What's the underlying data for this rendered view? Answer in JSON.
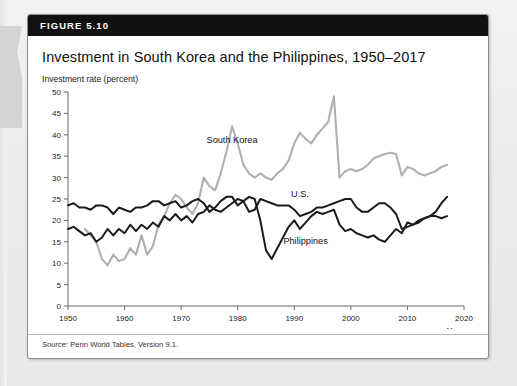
{
  "figure": {
    "number_label": "FIGURE 5.10",
    "title": "Investment in South Korea and the Philippines, 1950–2017",
    "source_label": "Source:",
    "source_text": " Penn World Tables, Version 9.1."
  },
  "colors": {
    "header_background": "#111111",
    "header_text": "#ffffff",
    "card_background": "#ffffff",
    "page_background": "#ececec",
    "south_korea": "#b0b0b0",
    "philippines": "#1a1a1a",
    "united_states": "#1a1a1a",
    "axis": "#6b6b6b"
  },
  "chart_data": {
    "type": "line",
    "title": "Investment in South Korea and the Philippines, 1950–2017",
    "ylabel": "Investment rate (percent)",
    "xlabel": "Year",
    "xlim": [
      1950,
      2020
    ],
    "ylim": [
      0,
      50
    ],
    "grid": false,
    "legend": "inline-labels",
    "xticks": [
      1950,
      1960,
      1970,
      1980,
      1990,
      2000,
      2010,
      2020
    ],
    "yticks": [
      0,
      5,
      10,
      15,
      20,
      25,
      30,
      35,
      40,
      45,
      50
    ],
    "annotations": [
      {
        "text": "South Korea",
        "x": 1979,
        "y": 38
      },
      {
        "text": "U.S.",
        "x": 1991,
        "y": 25.5
      },
      {
        "text": "Philippines",
        "x": 1992,
        "y": 14.5
      }
    ],
    "series": [
      {
        "name": "South Korea",
        "color": "#b0b0b0",
        "x": [
          1953,
          1954,
          1955,
          1956,
          1957,
          1958,
          1959,
          1960,
          1961,
          1962,
          1963,
          1964,
          1965,
          1966,
          1967,
          1968,
          1969,
          1970,
          1971,
          1972,
          1973,
          1974,
          1975,
          1976,
          1977,
          1978,
          1979,
          1980,
          1981,
          1982,
          1983,
          1984,
          1985,
          1986,
          1987,
          1988,
          1989,
          1990,
          1991,
          1992,
          1993,
          1994,
          1995,
          1996,
          1997,
          1998,
          1999,
          2000,
          2001,
          2002,
          2003,
          2004,
          2005,
          2006,
          2007,
          2008,
          2009,
          2010,
          2011,
          2012,
          2013,
          2014,
          2015,
          2016,
          2017
        ],
        "values": [
          18.0,
          16.5,
          15.0,
          11.0,
          9.5,
          12.0,
          10.5,
          11.0,
          13.5,
          12.0,
          16.5,
          12.0,
          14.0,
          19.0,
          21.0,
          24.0,
          26.0,
          25.0,
          23.0,
          21.5,
          24.0,
          30.0,
          28.0,
          27.0,
          31.0,
          36.0,
          42.0,
          38.0,
          33.0,
          31.0,
          30.0,
          31.0,
          30.0,
          29.5,
          31.0,
          32.0,
          34.0,
          38.0,
          40.5,
          39.0,
          38.0,
          40.0,
          41.5,
          43.0,
          49.0,
          30.0,
          31.5,
          32.0,
          31.5,
          32.0,
          33.0,
          34.5,
          35.0,
          35.5,
          35.8,
          35.5,
          30.5,
          32.5,
          32.0,
          31.0,
          30.5,
          31.0,
          31.5,
          32.5,
          33.0
        ]
      },
      {
        "name": "Philippines",
        "color": "#1a1a1a",
        "x": [
          1950,
          1951,
          1952,
          1953,
          1954,
          1955,
          1956,
          1957,
          1958,
          1959,
          1960,
          1961,
          1962,
          1963,
          1964,
          1965,
          1966,
          1967,
          1968,
          1969,
          1970,
          1971,
          1972,
          1973,
          1974,
          1975,
          1976,
          1977,
          1978,
          1979,
          1980,
          1981,
          1982,
          1983,
          1984,
          1985,
          1986,
          1987,
          1988,
          1989,
          1990,
          1991,
          1992,
          1993,
          1994,
          1995,
          1996,
          1997,
          1998,
          1999,
          2000,
          2001,
          2002,
          2003,
          2004,
          2005,
          2006,
          2007,
          2008,
          2009,
          2010,
          2011,
          2012,
          2013,
          2014,
          2015,
          2016,
          2017
        ],
        "values": [
          18.0,
          18.5,
          17.5,
          16.5,
          17.0,
          15.0,
          16.0,
          18.0,
          16.5,
          18.0,
          17.0,
          19.0,
          17.5,
          19.0,
          18.0,
          19.5,
          18.5,
          21.0,
          20.0,
          21.5,
          20.0,
          21.0,
          19.5,
          21.5,
          22.0,
          23.5,
          22.5,
          22.0,
          23.0,
          24.0,
          25.0,
          24.5,
          25.5,
          25.0,
          20.0,
          13.0,
          11.0,
          13.5,
          16.0,
          18.5,
          20.0,
          18.0,
          19.5,
          21.0,
          22.0,
          21.5,
          22.0,
          22.5,
          19.0,
          17.5,
          18.0,
          17.0,
          16.5,
          16.0,
          16.5,
          15.5,
          15.0,
          16.5,
          18.0,
          17.0,
          19.5,
          19.0,
          19.5,
          20.5,
          21.0,
          22.0,
          24.0,
          25.5
        ]
      },
      {
        "name": "U.S.",
        "color": "#1a1a1a",
        "x": [
          1950,
          1951,
          1952,
          1953,
          1954,
          1955,
          1956,
          1957,
          1958,
          1959,
          1960,
          1961,
          1962,
          1963,
          1964,
          1965,
          1966,
          1967,
          1968,
          1969,
          1970,
          1971,
          1972,
          1973,
          1974,
          1975,
          1976,
          1977,
          1978,
          1979,
          1980,
          1981,
          1982,
          1983,
          1984,
          1985,
          1986,
          1987,
          1988,
          1989,
          1990,
          1991,
          1992,
          1993,
          1994,
          1995,
          1996,
          1997,
          1998,
          1999,
          2000,
          2001,
          2002,
          2003,
          2004,
          2005,
          2006,
          2007,
          2008,
          2009,
          2010,
          2011,
          2012,
          2013,
          2014,
          2015,
          2016,
          2017
        ],
        "values": [
          23.5,
          24.0,
          23.0,
          23.0,
          22.5,
          23.5,
          23.5,
          23.0,
          21.5,
          23.0,
          22.5,
          22.0,
          23.0,
          23.0,
          23.5,
          24.5,
          24.5,
          23.5,
          24.0,
          24.5,
          23.0,
          23.5,
          24.5,
          25.0,
          24.0,
          22.0,
          23.0,
          24.5,
          25.5,
          25.5,
          23.5,
          24.5,
          22.0,
          22.5,
          25.0,
          24.5,
          24.0,
          23.5,
          23.5,
          23.5,
          22.5,
          21.0,
          21.5,
          22.0,
          23.0,
          23.0,
          23.5,
          24.0,
          24.5,
          25.0,
          25.0,
          23.0,
          22.0,
          22.0,
          23.0,
          24.0,
          24.0,
          23.0,
          21.5,
          18.0,
          18.5,
          19.0,
          20.0,
          20.5,
          21.0,
          21.0,
          20.5,
          21.0
        ]
      }
    ]
  }
}
